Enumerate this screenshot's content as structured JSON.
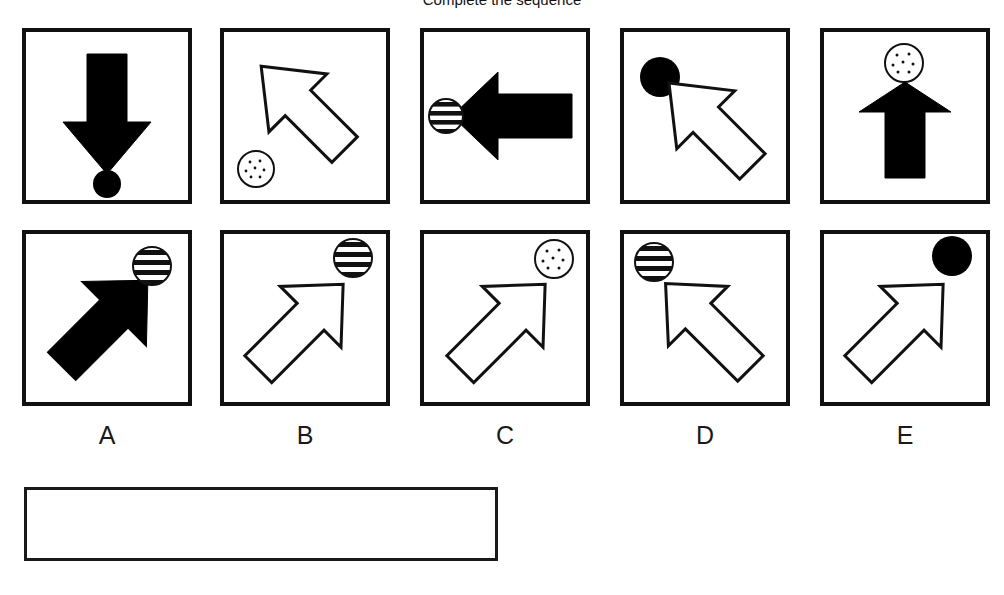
{
  "header": {
    "title": "Complete the sequence"
  },
  "test": {
    "stimulus_row_name": "stimulus-row",
    "options_row_name": "options-row"
  },
  "colors": {
    "ink": "#111111",
    "paper": "#ffffff",
    "fill_solid": "#000000",
    "fill_none": "#ffffff"
  },
  "stimuli": [
    {
      "index": 1,
      "panel_name": "stimulus-panel-1",
      "arrow": {
        "direction": "down",
        "fill": "solid",
        "icon": "arrow-down-icon"
      },
      "circle": {
        "pattern": "solid",
        "position": "bottom-center",
        "icon": "solid-circle-icon"
      }
    },
    {
      "index": 2,
      "panel_name": "stimulus-panel-2",
      "arrow": {
        "direction": "down-left",
        "fill": "outline",
        "icon": "arrow-down-left-icon"
      },
      "circle": {
        "pattern": "dotted",
        "position": "bottom-left",
        "icon": "dotted-circle-icon"
      }
    },
    {
      "index": 3,
      "panel_name": "stimulus-panel-3",
      "arrow": {
        "direction": "left",
        "fill": "solid",
        "icon": "arrow-left-icon"
      },
      "circle": {
        "pattern": "striped",
        "position": "left-center",
        "icon": "striped-circle-icon"
      }
    },
    {
      "index": 4,
      "panel_name": "stimulus-panel-4",
      "arrow": {
        "direction": "up-left",
        "fill": "outline",
        "icon": "arrow-up-left-icon"
      },
      "circle": {
        "pattern": "solid",
        "position": "top-left",
        "icon": "solid-circle-icon"
      }
    },
    {
      "index": 5,
      "panel_name": "stimulus-panel-5",
      "arrow": {
        "direction": "up",
        "fill": "solid",
        "icon": "arrow-up-icon"
      },
      "circle": {
        "pattern": "dotted",
        "position": "top-center",
        "icon": "dotted-circle-icon"
      }
    }
  ],
  "options": [
    {
      "label": "A",
      "panel_name": "option-panel-a",
      "arrow": {
        "direction": "up-right",
        "fill": "solid",
        "icon": "arrow-up-right-icon"
      },
      "circle": {
        "pattern": "striped",
        "position": "top-right",
        "icon": "striped-circle-icon"
      }
    },
    {
      "label": "B",
      "panel_name": "option-panel-b",
      "arrow": {
        "direction": "up-right",
        "fill": "outline",
        "icon": "arrow-up-right-icon"
      },
      "circle": {
        "pattern": "striped",
        "position": "top-right",
        "icon": "striped-circle-icon"
      }
    },
    {
      "label": "C",
      "panel_name": "option-panel-c",
      "arrow": {
        "direction": "up-right",
        "fill": "outline",
        "icon": "arrow-up-right-icon"
      },
      "circle": {
        "pattern": "dotted",
        "position": "top-right",
        "icon": "dotted-circle-icon"
      }
    },
    {
      "label": "D",
      "panel_name": "option-panel-d",
      "arrow": {
        "direction": "up-left",
        "fill": "outline",
        "icon": "arrow-up-left-icon"
      },
      "circle": {
        "pattern": "striped",
        "position": "top-left",
        "icon": "striped-circle-icon"
      }
    },
    {
      "label": "E",
      "panel_name": "option-panel-e",
      "arrow": {
        "direction": "up-right",
        "fill": "outline",
        "icon": "arrow-up-right-icon"
      },
      "circle": {
        "pattern": "solid",
        "position": "top-right",
        "icon": "solid-circle-icon"
      }
    }
  ],
  "answer_box": {
    "value": "",
    "placeholder": ""
  }
}
